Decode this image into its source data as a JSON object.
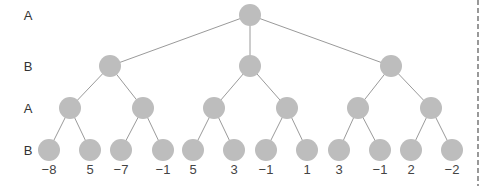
{
  "colors": {
    "node_fill": "#bdbdbd",
    "edge": "#9a9a9a",
    "border_dash": "#555555",
    "text": "#333333"
  },
  "node_radius": 11,
  "row_labels": [
    {
      "text": "A",
      "x": 28,
      "y": 15
    },
    {
      "text": "B",
      "x": 28,
      "y": 66
    },
    {
      "text": "A",
      "x": 28,
      "y": 108
    },
    {
      "text": "B",
      "x": 28,
      "y": 150
    }
  ],
  "nodes": [
    {
      "id": "n0",
      "x": 250,
      "y": 15,
      "parent": null
    },
    {
      "id": "n1",
      "x": 110,
      "y": 66,
      "parent": "n0"
    },
    {
      "id": "n2",
      "x": 250,
      "y": 66,
      "parent": "n0"
    },
    {
      "id": "n3",
      "x": 391,
      "y": 66,
      "parent": "n0"
    },
    {
      "id": "n4",
      "x": 70,
      "y": 108,
      "parent": "n1"
    },
    {
      "id": "n5",
      "x": 143,
      "y": 108,
      "parent": "n1"
    },
    {
      "id": "n6",
      "x": 214,
      "y": 108,
      "parent": "n2"
    },
    {
      "id": "n7",
      "x": 287,
      "y": 108,
      "parent": "n2"
    },
    {
      "id": "n8",
      "x": 358,
      "y": 108,
      "parent": "n3"
    },
    {
      "id": "n9",
      "x": 431,
      "y": 108,
      "parent": "n3"
    },
    {
      "id": "l0",
      "x": 49,
      "y": 150,
      "parent": "n4"
    },
    {
      "id": "l1",
      "x": 90,
      "y": 150,
      "parent": "n4"
    },
    {
      "id": "l2",
      "x": 121,
      "y": 150,
      "parent": "n5"
    },
    {
      "id": "l3",
      "x": 163,
      "y": 150,
      "parent": "n5"
    },
    {
      "id": "l4",
      "x": 193,
      "y": 150,
      "parent": "n6"
    },
    {
      "id": "l5",
      "x": 234,
      "y": 150,
      "parent": "n6"
    },
    {
      "id": "l6",
      "x": 266,
      "y": 150,
      "parent": "n7"
    },
    {
      "id": "l7",
      "x": 307,
      "y": 150,
      "parent": "n7"
    },
    {
      "id": "l8",
      "x": 339,
      "y": 150,
      "parent": "n8"
    },
    {
      "id": "l9",
      "x": 380,
      "y": 150,
      "parent": "n8"
    },
    {
      "id": "l10",
      "x": 411,
      "y": 150,
      "parent": "n9"
    },
    {
      "id": "l11",
      "x": 452,
      "y": 150,
      "parent": "n9"
    }
  ],
  "leaf_values": [
    {
      "text": "−8",
      "x": 49,
      "y": 169
    },
    {
      "text": "5",
      "x": 90,
      "y": 169
    },
    {
      "text": "−7",
      "x": 121,
      "y": 169
    },
    {
      "text": "−1",
      "x": 163,
      "y": 169
    },
    {
      "text": "5",
      "x": 193,
      "y": 169
    },
    {
      "text": "3",
      "x": 234,
      "y": 169
    },
    {
      "text": "−1",
      "x": 266,
      "y": 169
    },
    {
      "text": "1",
      "x": 307,
      "y": 169
    },
    {
      "text": "3",
      "x": 339,
      "y": 169
    },
    {
      "text": "−1",
      "x": 380,
      "y": 169
    },
    {
      "text": "2",
      "x": 411,
      "y": 169
    },
    {
      "text": "−2",
      "x": 452,
      "y": 169
    }
  ],
  "border": {
    "x": 478,
    "y1": 0,
    "y2": 186
  }
}
